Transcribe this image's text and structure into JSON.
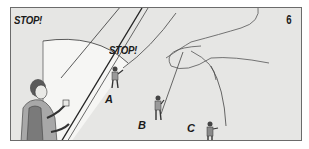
{
  "figure": {
    "panel_number": "6",
    "callouts": [
      {
        "id": "stop-top-left",
        "text": "STOP!"
      },
      {
        "id": "stop-near-a",
        "text": "STOP!"
      }
    ],
    "climbers": [
      {
        "label": "A"
      },
      {
        "label": "B"
      },
      {
        "label": "C"
      }
    ],
    "colors": {
      "background": "#e6e6e4",
      "highlight": "#f6f6f4",
      "ink": "#1a1a1a",
      "border": "#6b6b6b",
      "shirt": "#a8a8a8",
      "vest": "#7a7a7a"
    }
  }
}
